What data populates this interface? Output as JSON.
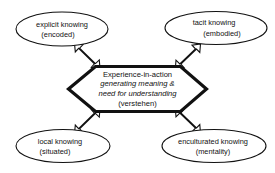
{
  "diagram": {
    "background_color": "#ffffff",
    "line_color": "#111111",
    "center": {
      "shape": "hexagon",
      "lines": [
        {
          "text": "Experience-in-action",
          "style": "regular"
        },
        {
          "text": "generating meaning &",
          "style": "italic"
        },
        {
          "text": "need for understanding",
          "style": "italic"
        },
        {
          "text": "(verstehen)",
          "style": "regular"
        }
      ]
    },
    "nodes": [
      {
        "id": "explicit-knowing",
        "position": "top-left",
        "shape": "ellipse",
        "line1": "explicit knowing",
        "line2": "(encoded)"
      },
      {
        "id": "tacit-knowing",
        "position": "top-right",
        "shape": "ellipse",
        "line1": "tacit knowing",
        "line2": "(embodied)"
      },
      {
        "id": "local-knowing",
        "position": "bottom-left",
        "shape": "ellipse",
        "line1": "local knowing",
        "line2": "(situated)"
      },
      {
        "id": "enculturated-knowing",
        "position": "bottom-right",
        "shape": "ellipse",
        "line1": "enculturated knowing",
        "line2": "(mentality)"
      }
    ],
    "connectors": [
      {
        "id": "connector-explicit",
        "from": "center",
        "to": "explicit-knowing",
        "style": "double-headed-open-arrow"
      },
      {
        "id": "connector-tacit",
        "from": "center",
        "to": "tacit-knowing",
        "style": "double-headed-open-arrow"
      },
      {
        "id": "connector-local",
        "from": "center",
        "to": "local-knowing",
        "style": "double-headed-open-arrow"
      },
      {
        "id": "connector-enculturated",
        "from": "center",
        "to": "enculturated-knowing",
        "style": "double-headed-open-arrow"
      }
    ]
  }
}
